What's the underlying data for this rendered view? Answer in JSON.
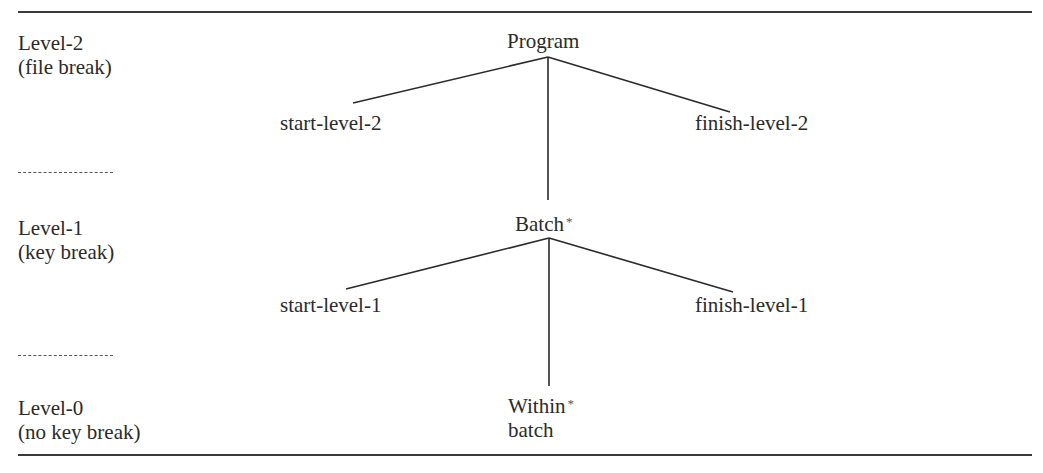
{
  "levels": [
    {
      "name": "Level-2",
      "description": "(file break)"
    },
    {
      "name": "Level-1",
      "description": "(key break)"
    },
    {
      "name": "Level-0",
      "description": "(no key break)"
    }
  ],
  "separator": "-------",
  "nodes": {
    "program": {
      "label": "Program",
      "marker": ""
    },
    "start_level_2": {
      "label": "start-level-2"
    },
    "finish_level_2": {
      "label": "finish-level-2"
    },
    "batch": {
      "label": "Batch",
      "marker": "*"
    },
    "start_level_1": {
      "label": "start-level-1"
    },
    "finish_level_1": {
      "label": "finish-level-1"
    },
    "within_batch": {
      "label_line1": "Within",
      "label_line2": "batch",
      "marker": "*"
    }
  },
  "edges": [
    {
      "from": "Program",
      "to": "start-level-2"
    },
    {
      "from": "Program",
      "to": "finish-level-2"
    },
    {
      "from": "Program",
      "to": "Batch"
    },
    {
      "from": "Batch",
      "to": "start-level-1"
    },
    {
      "from": "Batch",
      "to": "finish-level-1"
    },
    {
      "from": "Batch",
      "to": "Within batch"
    }
  ],
  "colors": {
    "line": "#2a2a2a",
    "text": "#2a2a2a",
    "background": "#ffffff"
  }
}
